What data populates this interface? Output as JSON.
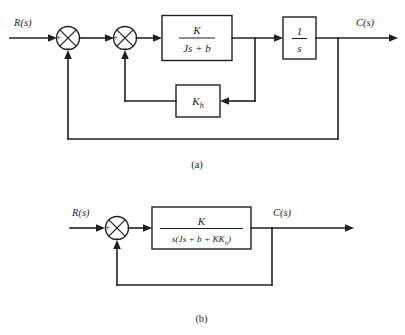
{
  "figure": {
    "ink_color": "#231f20",
    "background": "#ffffff"
  },
  "diagram_a": {
    "caption": "(a)",
    "input_label": "R(s)",
    "output_label": "C(s)",
    "sum1": {
      "name": "outer-summing-junction",
      "plus_sign": "+",
      "minus_sign": "–"
    },
    "sum2": {
      "name": "inner-summing-junction",
      "plus_sign": "+",
      "minus_sign": "–"
    },
    "blocks": [
      {
        "id": "plant-block",
        "numerator": "K",
        "denominator": "Js + b",
        "expression": "K / (Js + b)"
      },
      {
        "id": "integrator-block",
        "numerator": "1",
        "denominator": "s",
        "expression": "1 / s"
      },
      {
        "id": "tachometer-block",
        "base": "K",
        "subscript": "h",
        "expression": "K_h"
      }
    ]
  },
  "diagram_b": {
    "caption": "(b)",
    "input_label": "R(s)",
    "output_label": "C(s)",
    "sum1": {
      "name": "summing-junction",
      "plus_sign": "+",
      "minus_sign": "–"
    },
    "blocks": [
      {
        "id": "combined-block",
        "numerator": "K",
        "denominator_pre": "s(Js + b + KK",
        "denominator_sub": "h",
        "denominator_post": ")",
        "expression": "K / (s(Js + b + KK_h))"
      }
    ]
  }
}
